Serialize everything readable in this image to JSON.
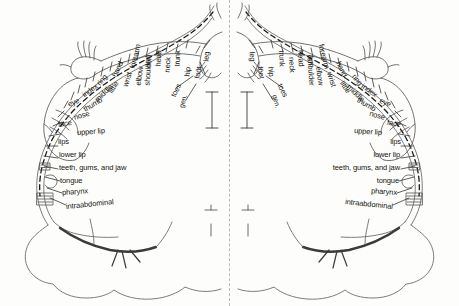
{
  "diagram": {
    "type": "coronal-section-homunculus",
    "hemispheres": [
      "left",
      "right"
    ],
    "midline": "dashed",
    "ink_color": "#15150f",
    "line_color": "#6e6e6e",
    "midline_color": "#b9b9c4",
    "background_color": "#fdfdfc"
  },
  "labels": {
    "rotated": [
      {
        "text": "gen.",
        "angle": 74
      },
      {
        "text": "toes",
        "angle": 64
      },
      {
        "text": "foot",
        "angle": 80
      },
      {
        "text": "leg",
        "angle": 86
      },
      {
        "text": "hip",
        "angle": 84
      },
      {
        "text": "trunk",
        "angle": 88
      },
      {
        "text": "neck",
        "angle": 86
      },
      {
        "text": "head",
        "angle": 88
      },
      {
        "text": "shoulder",
        "angle": 86
      },
      {
        "text": "arm",
        "angle": 86
      },
      {
        "text": "elbow",
        "angle": 82
      },
      {
        "text": "forearm",
        "angle": 76
      },
      {
        "text": "wrist",
        "angle": 72
      },
      {
        "text": "hand",
        "angle": 64
      },
      {
        "text": "little",
        "angle": 58
      },
      {
        "text": "ring",
        "angle": 50
      },
      {
        "text": "middle",
        "angle": 44
      },
      {
        "text": "index",
        "angle": 36
      },
      {
        "text": "thumb",
        "angle": 30
      },
      {
        "text": "eye",
        "angle": 22
      },
      {
        "text": "nose",
        "angle": 16
      },
      {
        "text": "face",
        "angle": 9
      }
    ],
    "horizontal": [
      {
        "text": "upper lip"
      },
      {
        "text": "lips"
      },
      {
        "text": "lower lip"
      },
      {
        "text": "teeth, gums, and jaw"
      },
      {
        "text": "tongue"
      },
      {
        "text": "pharynx"
      },
      {
        "text": "intraabdominal"
      }
    ]
  },
  "left_hemisphere": {
    "rotated_labels": [
      "gen.",
      "toes",
      "foot",
      "leg",
      "hip",
      "trunk",
      "neck",
      "head",
      "shoulder",
      "arm",
      "elbow",
      "forearm",
      "wrist",
      "hand",
      "little",
      "ring",
      "middle",
      "index",
      "thumb",
      "eye",
      "nose",
      "face"
    ],
    "horizontal_labels": [
      "upper lip",
      "lips",
      "lower lip",
      "teeth, gums, and jaw",
      "tongue",
      "pharynx",
      "intraabdominal"
    ]
  },
  "right_hemisphere": {
    "rotated_labels": [
      "gen.",
      "toes",
      "foot",
      "leg",
      "hip",
      "trunk",
      "neck",
      "head",
      "shoulder",
      "arm",
      "elbow",
      "forearm",
      "wrist",
      "hand",
      "little",
      "ring",
      "middle",
      "index",
      "thumb",
      "eye",
      "nose",
      "face"
    ],
    "horizontal_labels": [
      "upper lip",
      "lips",
      "lower lip",
      "teeth, gums, and jaw",
      "tongue",
      "pharynx",
      "intraabdominal"
    ]
  }
}
